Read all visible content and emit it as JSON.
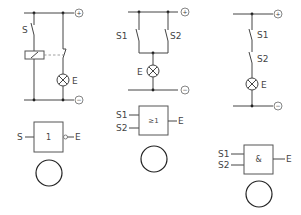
{
  "diagram": {
    "terminals": {
      "plus": "+",
      "minus": "−"
    },
    "circuits": [
      {
        "id": "not",
        "switch_labels": [
          "S"
        ],
        "lamp_label": "E",
        "gate": {
          "symbol": "1",
          "inputs": [
            "S"
          ],
          "output": "E",
          "negated_output": true
        }
      },
      {
        "id": "or",
        "switch_labels": [
          "S1",
          "S2"
        ],
        "lamp_label": "E",
        "gate": {
          "symbol": "≥1",
          "inputs": [
            "S1",
            "S2"
          ],
          "output": "E",
          "negated_output": false
        }
      },
      {
        "id": "and",
        "switch_labels": [
          "S1",
          "S2"
        ],
        "lamp_label": "E",
        "gate": {
          "symbol": "&",
          "inputs": [
            "S1",
            "S2"
          ],
          "output": "E",
          "negated_output": false
        }
      }
    ]
  }
}
